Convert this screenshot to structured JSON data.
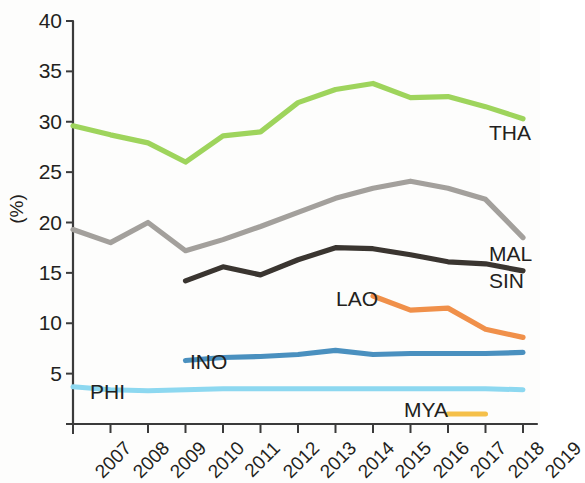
{
  "chart_data": {
    "type": "line",
    "title": "",
    "subtitle": "",
    "xlabel": "",
    "ylabel": "(%)",
    "categories": [
      "2007",
      "2008",
      "2009",
      "2010",
      "2011",
      "2012",
      "2013",
      "2014",
      "2015",
      "2016",
      "2017",
      "2018",
      "2019"
    ],
    "x": [
      2007,
      2008,
      2009,
      2010,
      2011,
      2012,
      2013,
      2014,
      2015,
      2016,
      2017,
      2018,
      2019
    ],
    "xlim": [
      2007,
      2019
    ],
    "ylim": [
      0,
      40
    ],
    "yticks": [
      0,
      5,
      10,
      15,
      20,
      25,
      30,
      35,
      40
    ],
    "ytick_labels": [
      "",
      "5",
      "10",
      "15",
      "20",
      "25",
      "30",
      "35",
      "40"
    ],
    "grid": false,
    "legend": "inline-end-labels",
    "series": [
      {
        "name": "THA",
        "label": "THA",
        "color": "#9ed45c",
        "values": [
          29.6,
          28.7,
          27.9,
          26.0,
          28.6,
          29.0,
          31.9,
          33.2,
          33.8,
          32.4,
          32.5,
          31.5,
          30.3
        ]
      },
      {
        "name": "MAL",
        "label": "MAL",
        "color": "#a3a09c",
        "values": [
          19.3,
          18.0,
          20.0,
          17.2,
          18.3,
          19.6,
          21.0,
          22.4,
          23.4,
          24.1,
          23.4,
          22.3,
          18.5
        ]
      },
      {
        "name": "SIN",
        "label": "SIN",
        "color": "#3a3530",
        "values": [
          null,
          null,
          null,
          14.2,
          15.6,
          14.8,
          16.3,
          17.5,
          17.4,
          16.8,
          16.1,
          15.9,
          15.2
        ]
      },
      {
        "name": "LAO",
        "label": "LAO",
        "color": "#f0904a",
        "values": [
          null,
          null,
          null,
          null,
          null,
          null,
          null,
          null,
          12.7,
          11.3,
          11.5,
          9.4,
          8.6
        ]
      },
      {
        "name": "INO",
        "label": "INO",
        "color": "#4a90bf",
        "values": [
          null,
          null,
          null,
          6.3,
          6.6,
          6.7,
          6.9,
          7.3,
          6.9,
          7.0,
          7.0,
          7.0,
          7.1
        ]
      },
      {
        "name": "PHI",
        "label": "PHI",
        "color": "#8dd8f0",
        "values": [
          3.7,
          3.4,
          3.3,
          3.4,
          3.5,
          3.5,
          3.5,
          3.5,
          3.5,
          3.5,
          3.5,
          3.5,
          3.4
        ]
      },
      {
        "name": "MYA",
        "label": "MYA",
        "color": "#f5c04a",
        "values": [
          null,
          null,
          null,
          null,
          null,
          null,
          null,
          null,
          null,
          null,
          1.0,
          1.0,
          null
        ]
      }
    ]
  },
  "axis": {
    "y_title": "(%)",
    "y_tick_labels": [
      "40",
      "35",
      "30",
      "25",
      "20",
      "15",
      "10",
      "5"
    ],
    "x_tick_labels": [
      "2007",
      "2008",
      "2009",
      "2010",
      "2011",
      "2012",
      "2013",
      "2014",
      "2015",
      "2016",
      "2017",
      "2018",
      "2019"
    ]
  },
  "series_labels": {
    "tha": "THA",
    "mal": "MAL",
    "sin": "SIN",
    "lao": "LAO",
    "ino": "INO",
    "phi": "PHI",
    "mya": "MYA"
  }
}
